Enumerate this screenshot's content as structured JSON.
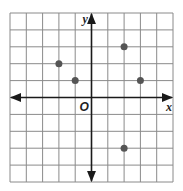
{
  "chart_data": {
    "type": "scatter",
    "title": "",
    "xlabel": "x",
    "ylabel": "y",
    "origin_label": "O",
    "xlim": [
      -5,
      5
    ],
    "ylim": [
      -5,
      5
    ],
    "grid": true,
    "tick_labels_shown": false,
    "points": [
      {
        "x": -2,
        "y": 2
      },
      {
        "x": -1,
        "y": 1
      },
      {
        "x": 2,
        "y": 3
      },
      {
        "x": 3,
        "y": 1
      },
      {
        "x": 2,
        "y": -3
      }
    ]
  },
  "colors": {
    "grid": "#8a8a8a",
    "axes": "#1a1a1a",
    "points": "#555555",
    "background": "#ffffff"
  }
}
